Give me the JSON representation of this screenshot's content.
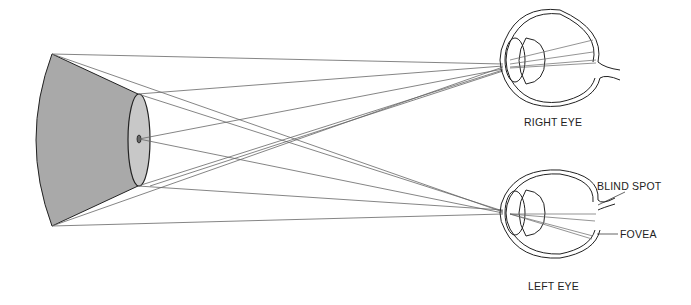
{
  "diagram": {
    "labels": {
      "right_eye": "RIGHT EYE",
      "left_eye": "LEFT EYE",
      "blind_spot": "BLIND SPOT",
      "fovea": "FOVEA"
    },
    "colors": {
      "cone_fill": "#a9a9a9",
      "face_fill": "#c8c8c8",
      "line": "#555555",
      "outline": "#222222"
    }
  }
}
